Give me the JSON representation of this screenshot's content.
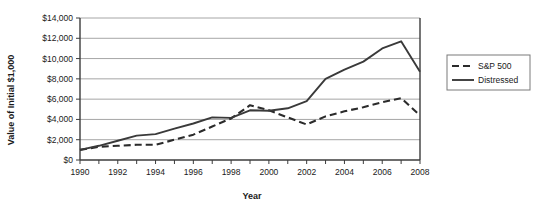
{
  "chart_data": {
    "type": "line",
    "title": "",
    "xlabel": "Year",
    "ylabel": "Value of Initial $1,000",
    "xlim": [
      1990,
      2008
    ],
    "ylim": [
      0,
      14000
    ],
    "grid": true,
    "legend_position": "right",
    "x": [
      1990,
      1991,
      1992,
      1993,
      1994,
      1995,
      1996,
      1997,
      1998,
      1999,
      2000,
      2001,
      2002,
      2003,
      2004,
      2005,
      2006,
      2007,
      2008
    ],
    "xtick_labels": [
      "1990",
      "1992",
      "1994",
      "1996",
      "1998",
      "2000",
      "2002",
      "2004",
      "2006",
      "2008"
    ],
    "xtick_values": [
      1990,
      1992,
      1994,
      1996,
      1998,
      2000,
      2002,
      2004,
      2006,
      2008
    ],
    "ytick_labels": [
      "$0",
      "$2,000",
      "$4,000",
      "$6,000",
      "$8,000",
      "$10,000",
      "$12,000",
      "$14,000"
    ],
    "ytick_values": [
      0,
      2000,
      4000,
      6000,
      8000,
      10000,
      12000,
      14000
    ],
    "series": [
      {
        "name": "S&P 500",
        "style": "dashed",
        "color": "#2b2b2b",
        "values": [
          1000,
          1300,
          1400,
          1500,
          1500,
          2000,
          2500,
          3300,
          4100,
          5400,
          4900,
          4200,
          3500,
          4300,
          4800,
          5200,
          5700,
          6100,
          4400
        ]
      },
      {
        "name": "Distressed",
        "style": "solid",
        "color": "#3a3a3a",
        "values": [
          1000,
          1400,
          1900,
          2400,
          2550,
          3100,
          3600,
          4200,
          4150,
          4900,
          4850,
          5100,
          5800,
          8000,
          8900,
          9700,
          11000,
          11700,
          8700
        ]
      }
    ]
  },
  "legend": {
    "entries": [
      {
        "label": "S&P 500",
        "style": "dashed"
      },
      {
        "label": "Distressed",
        "style": "solid"
      }
    ]
  }
}
